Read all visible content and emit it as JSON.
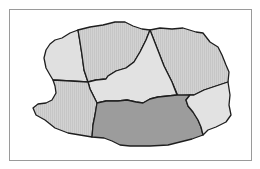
{
  "map": {
    "frame": {
      "border_color": "#9a9a9a",
      "background": "#ffffff"
    },
    "colors": {
      "hatched_light": "#cfcfcf",
      "very_light": "#e2e2e2",
      "highlighted": "#9b9b9b",
      "border": "#1e1e1e"
    },
    "regions": [
      {
        "id": "northwest",
        "fill_key": "very_light"
      },
      {
        "id": "north",
        "fill_key": "hatched_light"
      },
      {
        "id": "northeast",
        "fill_key": "hatched_light"
      },
      {
        "id": "center",
        "fill_key": "very_light"
      },
      {
        "id": "west",
        "fill_key": "hatched_light"
      },
      {
        "id": "south",
        "fill_key": "highlighted"
      },
      {
        "id": "east",
        "fill_key": "very_light"
      }
    ]
  }
}
